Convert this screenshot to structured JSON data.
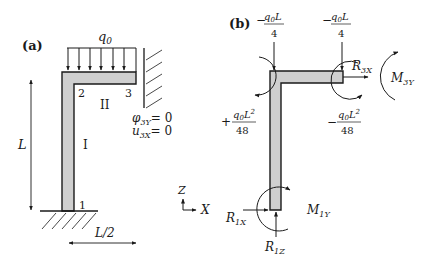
{
  "panel_a": {
    "label": "(a)",
    "load_label": "q",
    "load_sub": "0",
    "node_1": "1",
    "node_2": "2",
    "node_3": "3",
    "member_I": "I",
    "member_II": "II",
    "height_dim": "L",
    "width_dim": "L/2",
    "bc_1_sym": "φ",
    "bc_1_sub": "3Y",
    "bc_1_rhs": "= 0",
    "bc_2_sym": "u",
    "bc_2_sub": "3X",
    "bc_2_rhs": "= 0"
  },
  "axes": {
    "z_label": "Z",
    "x_label": "X"
  },
  "panel_b": {
    "label": "(b)",
    "force_left": {
      "sign": "−",
      "num_q": "q",
      "num_sub": "0",
      "num_L": "L",
      "den": "4"
    },
    "force_right": {
      "sign": "−",
      "num_q": "q",
      "num_sub": "0",
      "num_L": "L",
      "den": "4"
    },
    "moment_left": {
      "sign": "+",
      "num_q": "q",
      "num_sub": "0",
      "num_L": "L",
      "num_exp": "2",
      "den": "48"
    },
    "moment_right": {
      "sign": "−",
      "num_q": "q",
      "num_sub": "0",
      "num_L": "L",
      "num_exp": "2",
      "den": "48"
    },
    "r3x": {
      "sym": "R",
      "sub": "3X"
    },
    "m3y": {
      "sym": "M",
      "sub": "3Y"
    },
    "r1x": {
      "sym": "R",
      "sub": "1X"
    },
    "r1z": {
      "sym": "R",
      "sub": "1Z"
    },
    "m1y": {
      "sym": "M",
      "sub": "1Y"
    }
  }
}
